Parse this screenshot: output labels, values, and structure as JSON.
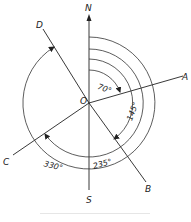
{
  "diagram": {
    "origin": {
      "label": "O"
    },
    "directions": {
      "north": {
        "label": "N"
      },
      "south": {
        "label": "S"
      }
    },
    "lines": [
      {
        "label": "A",
        "azimuth_deg": 70,
        "angle_label": "70°"
      },
      {
        "label": "B",
        "azimuth_deg": 145,
        "angle_label": "145°"
      },
      {
        "label": "C",
        "azimuth_deg": 235,
        "angle_label": "235°"
      },
      {
        "label": "D",
        "azimuth_deg": 330,
        "angle_label": "330°"
      }
    ]
  }
}
